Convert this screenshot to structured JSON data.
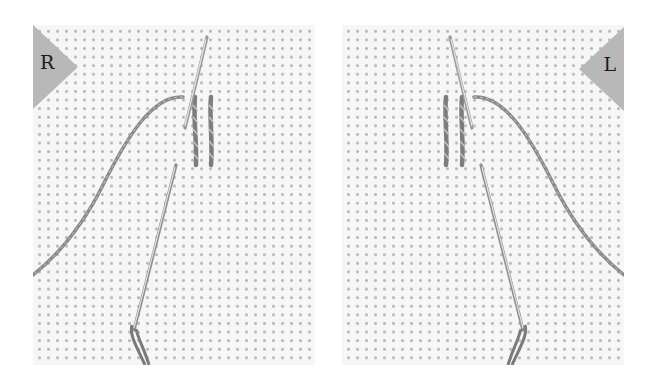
{
  "figure": {
    "panels": [
      {
        "id": "left",
        "badge_label": "R",
        "badge_side": "left",
        "description": "Right-handed stitching: needle on aida cloth with thread to the left"
      },
      {
        "id": "right",
        "badge_label": "L",
        "badge_side": "right",
        "description": "Left-handed stitching: mirrored view with thread to the right"
      }
    ],
    "colors": {
      "background": "#ffffff",
      "fabric": "#f6f6f6",
      "fabric_dots": "#b9b9b9",
      "badge": "#b8b8b8",
      "badge_text": "#1a1a1a",
      "thread": "#8a8a8a",
      "needle": "#bdbdbd"
    }
  }
}
